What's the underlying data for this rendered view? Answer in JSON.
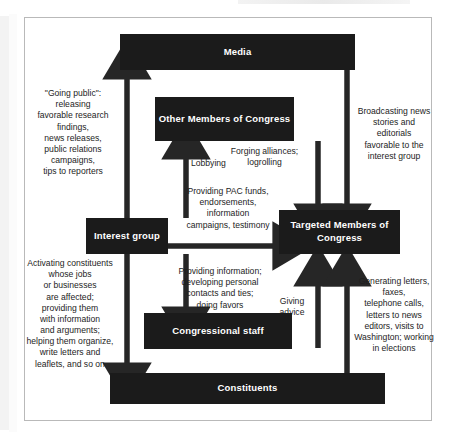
{
  "figure": {
    "title_partial": "",
    "nodes": [
      {
        "id": "media",
        "label": "Media"
      },
      {
        "id": "other-members",
        "label": "Other Members\nof Congress"
      },
      {
        "id": "interest-group",
        "label": "Interest\ngroup"
      },
      {
        "id": "targeted-members",
        "label": "Targeted Members\nof Congress"
      },
      {
        "id": "congressional-staff",
        "label": "Congressional\nstaff"
      },
      {
        "id": "constituents",
        "label": "Constituents"
      }
    ],
    "annotations": [
      {
        "id": "going-public",
        "text": "\"Going public\":\nreleasing\nfavorable research\nfindings,\nnews releases,\npublic relations\ncampaigns,\ntips to reporters"
      },
      {
        "id": "broadcasting",
        "text": "Broadcasting news\nstories and editorials\nfavorable to the\ninterest group"
      },
      {
        "id": "lobbying",
        "text": "Lobbying"
      },
      {
        "id": "forging-alliances",
        "text": "Forging alliances;\nlogrolling"
      },
      {
        "id": "providing-pac-funds",
        "text": "Providing PAC funds,\nendorsements,\ninformation\ncampaigns, testimony"
      },
      {
        "id": "activating-constituents",
        "text": "Activating constituents\nwhose jobs\nor businesses\nare affected;\nproviding them\nwith information\nand arguments;\nhelping them organize,\nwrite letters and\nleaflets, and so on"
      },
      {
        "id": "providing-information",
        "text": "Providing information;\ndeveloping personal\ncontacts and ties;\ndoing favors"
      },
      {
        "id": "giving-advice",
        "text": "Giving\nadvice"
      },
      {
        "id": "generating-letters",
        "text": "Generating letters, faxes,\ntelephone calls,\nletters to news\neditors, visits to\nWashington; working\nin elections"
      }
    ],
    "colors": {
      "node_fill": "#1b1b1b",
      "node_text": "#ffffff",
      "arrow": "#262626",
      "frame": "#b9b9b9",
      "background": "#ffffff"
    }
  }
}
